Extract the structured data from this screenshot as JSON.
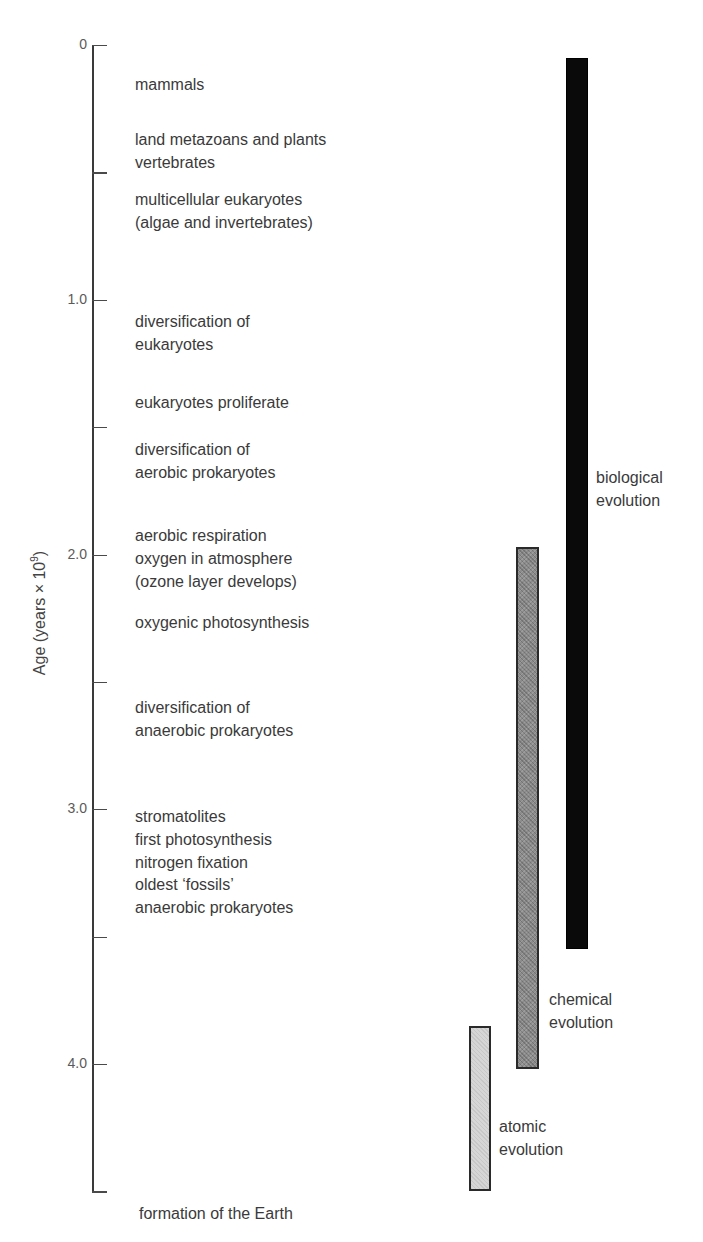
{
  "figure": {
    "type": "geological-timeline",
    "y_axis": {
      "title_prefix": "Age (years × 10",
      "title_exponent": "9",
      "title_suffix": ")",
      "min": 0,
      "max": 4.5,
      "major_ticks": [
        {
          "value": 0,
          "label": "0"
        },
        {
          "value": 1.0,
          "label": "1.0"
        },
        {
          "value": 2.0,
          "label": "2.0"
        },
        {
          "value": 3.0,
          "label": "3.0"
        },
        {
          "value": 4.0,
          "label": "4.0"
        }
      ],
      "minor_ticks": [
        0.5,
        1.5,
        2.5,
        3.5,
        4.5
      ]
    },
    "events": [
      {
        "lines": [
          "mammals"
        ],
        "top": 74
      },
      {
        "lines": [
          "land metazoans and plants",
          "vertebrates"
        ],
        "top": 129
      },
      {
        "lines": [
          "multicellular eukaryotes",
          "(algae and invertebrates)"
        ],
        "top": 189
      },
      {
        "lines": [
          "diversification of",
          "eukaryotes"
        ],
        "top": 311
      },
      {
        "lines": [
          "eukaryotes proliferate"
        ],
        "top": 392
      },
      {
        "lines": [
          "diversification of",
          "aerobic prokaryotes"
        ],
        "top": 439
      },
      {
        "lines": [
          "aerobic respiration",
          "oxygen in atmosphere",
          "(ozone layer develops)"
        ],
        "top": 525
      },
      {
        "lines": [
          "oxygenic photosynthesis"
        ],
        "top": 612
      },
      {
        "lines": [
          "diversification of",
          "anaerobic prokaryotes"
        ],
        "top": 697
      },
      {
        "lines": [
          "stromatolites",
          "first photosynthesis",
          "nitrogen fixation",
          "oldest ‘fossils’",
          "anaerobic prokaryotes"
        ],
        "top": 806
      },
      {
        "lines": [
          "formation of the Earth"
        ],
        "top": 1203,
        "left": 139
      }
    ],
    "bars": [
      {
        "id": "biological",
        "label_lines": [
          "biological",
          "evolution"
        ],
        "start_age": 0.05,
        "end_age": 3.55,
        "fill": "#0a0a0a",
        "x": 566,
        "width": 22,
        "label_x": 596,
        "label_top": 467
      },
      {
        "id": "chemical",
        "label_lines": [
          "chemical",
          "evolution"
        ],
        "start_age": 1.97,
        "end_age": 4.02,
        "fill": "#8c8c8c",
        "x": 516,
        "width": 23,
        "label_x": 549,
        "label_top": 989
      },
      {
        "id": "atomic",
        "label_lines": [
          "atomic",
          "evolution"
        ],
        "start_age": 3.85,
        "end_age": 4.5,
        "fill": "#d6d6d6",
        "x": 469,
        "width": 22,
        "label_x": 499,
        "label_top": 1116
      }
    ]
  },
  "chart_data": {
    "type": "timeline",
    "title": "",
    "ylabel": "Age (years × 10^9)",
    "xlabel": "",
    "ylim": [
      0,
      4.5
    ],
    "y_inverted": true,
    "y_ticks": [
      0,
      1.0,
      2.0,
      3.0,
      4.0
    ],
    "ranges": [
      {
        "name": "biological evolution",
        "start": 0.05,
        "end": 3.55
      },
      {
        "name": "chemical evolution",
        "start": 1.97,
        "end": 4.02
      },
      {
        "name": "atomic evolution",
        "start": 3.85,
        "end": 4.5
      }
    ],
    "events": [
      {
        "age": 0.15,
        "text": "mammals"
      },
      {
        "age": 0.4,
        "text": "land metazoans and plants; vertebrates"
      },
      {
        "age": 0.62,
        "text": "multicellular eukaryotes (algae and invertebrates)"
      },
      {
        "age": 1.1,
        "text": "diversification of eukaryotes"
      },
      {
        "age": 1.4,
        "text": "eukaryotes proliferate"
      },
      {
        "age": 1.65,
        "text": "diversification of aerobic prokaryotes"
      },
      {
        "age": 2.0,
        "text": "aerobic respiration; oxygen in atmosphere (ozone layer develops)"
      },
      {
        "age": 2.3,
        "text": "oxygenic photosynthesis"
      },
      {
        "age": 2.7,
        "text": "diversification of anaerobic prokaryotes"
      },
      {
        "age": 3.1,
        "text": "stromatolites; first photosynthesis; nitrogen fixation; oldest 'fossils'; anaerobic prokaryotes"
      },
      {
        "age": 4.5,
        "text": "formation of the Earth"
      }
    ]
  }
}
